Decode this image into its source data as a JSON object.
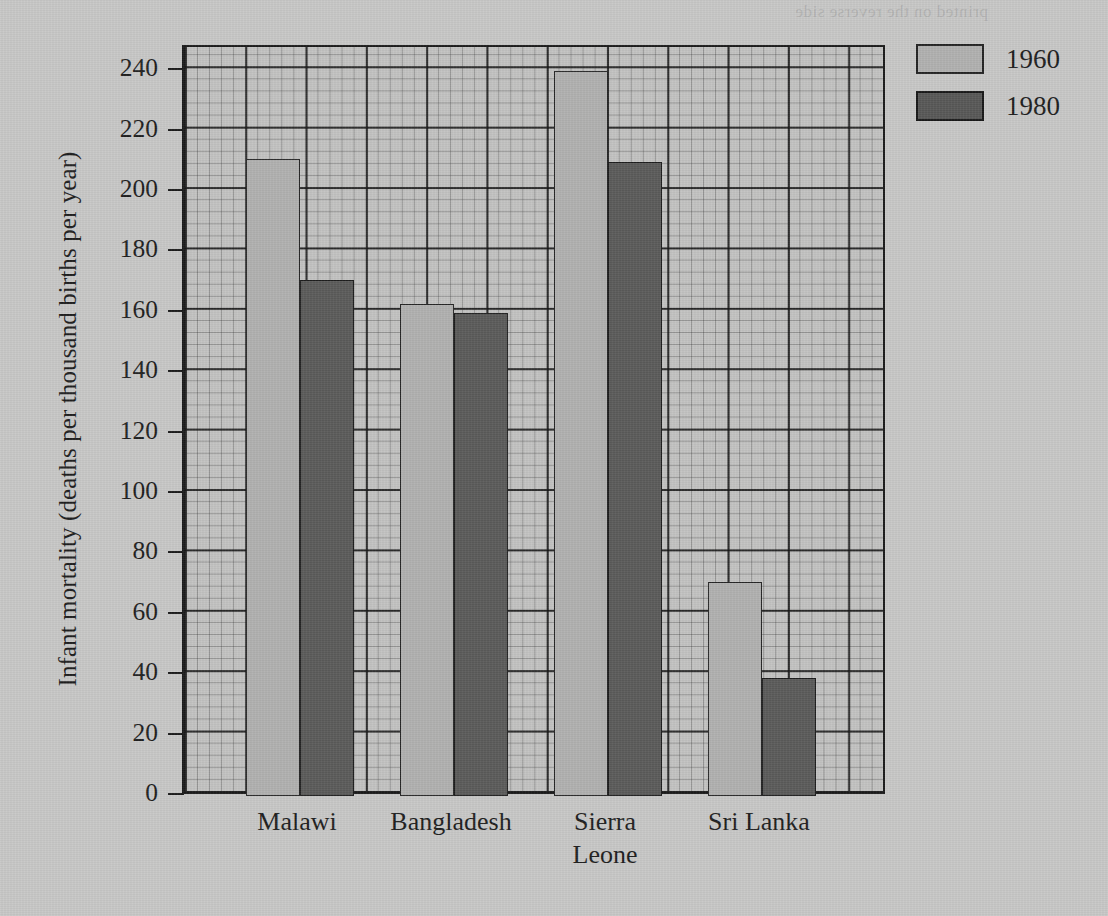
{
  "chart_data": {
    "type": "bar",
    "title": "",
    "xlabel": "",
    "ylabel": "Infant mortality (deaths per thousand births per year)",
    "categories": [
      "Malawi",
      "Bangladesh",
      "Sierra\nLeone",
      "Sri Lanka"
    ],
    "series": [
      {
        "name": "1960",
        "color": "#b0b0af",
        "values": [
          211,
          163,
          240,
          71
        ]
      },
      {
        "name": "1980",
        "color": "#5a5a59",
        "values": [
          171,
          160,
          210,
          39
        ]
      }
    ],
    "ylim": [
      0,
      248
    ],
    "yticks": [
      0,
      20,
      40,
      60,
      80,
      100,
      120,
      140,
      160,
      180,
      200,
      220,
      240
    ],
    "ytick_labels": [
      "0",
      "20",
      "40",
      "60",
      "80",
      "100",
      "120",
      "140",
      "160",
      "180",
      "200",
      "220",
      "240"
    ],
    "grid": "major and minor graph-paper grid",
    "legend_position": "top-right outside",
    "bar_group_order": [
      "1960",
      "1980"
    ]
  },
  "legend": {
    "entries": [
      {
        "label": "1960"
      },
      {
        "label": "1980"
      }
    ]
  },
  "artifacts": {
    "bleed_through_text": "printed on the reverse side"
  }
}
